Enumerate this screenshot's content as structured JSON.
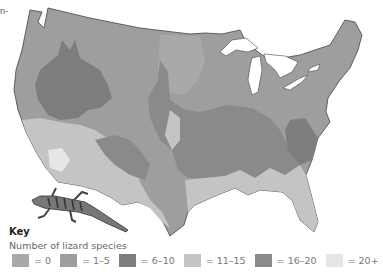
{
  "figure": {
    "corner_text": "n-",
    "map_subject": "United States (contiguous)",
    "illustration": "lizard-icon"
  },
  "key": {
    "title": "Key",
    "subtitle": "Number of lizard species",
    "items": [
      {
        "label": "= 0",
        "color": "#a9a9a9"
      },
      {
        "label": "= 1–5",
        "color": "#9e9e9e"
      },
      {
        "label": "= 6–10",
        "color": "#7d7d7d"
      },
      {
        "label": "= 11–15",
        "color": "#c4c4c4"
      },
      {
        "label": "= 16–20",
        "color": "#8a8a8a"
      },
      {
        "label": "= 20+",
        "color": "#e6e6e6"
      }
    ]
  },
  "colors": {
    "background": "#ffffff",
    "border": "#444444",
    "water": "#ffffff"
  }
}
